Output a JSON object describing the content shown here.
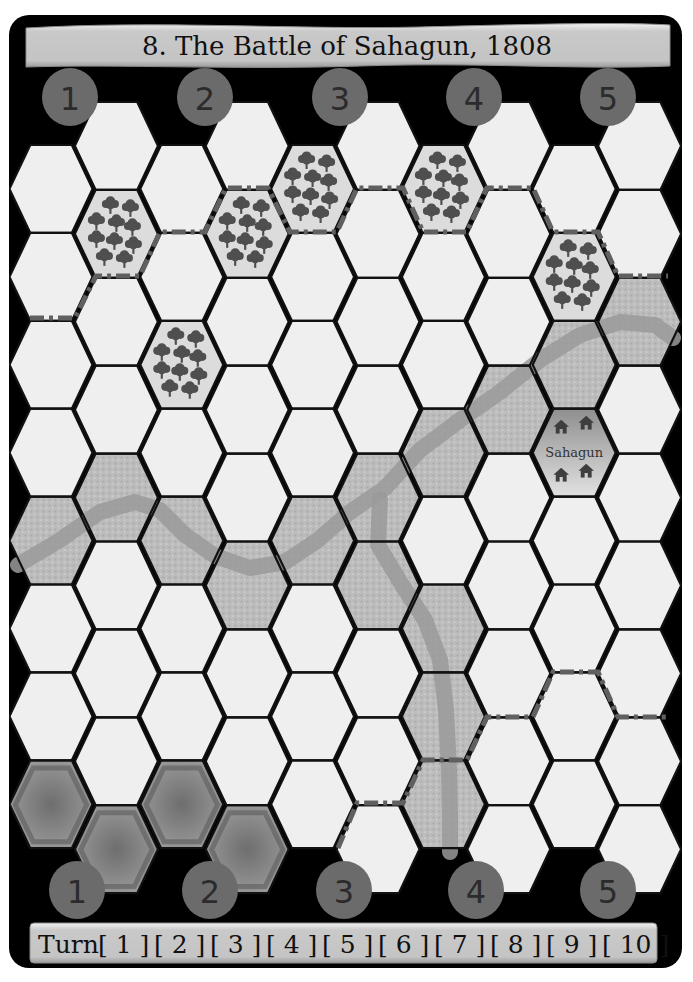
{
  "title": "8. The Battle of Sahagun, 1808",
  "colors": {
    "board_background": "#000000",
    "clear_hex": "#efefef",
    "forest_hex": "#dcdcdc",
    "marsh_hex": "#b9b9b9",
    "start_hex": "#8a8a8a",
    "badge": "#6b6b6b",
    "banner": "#c6c6c6",
    "road": "#606060",
    "river": "#9a9a9a"
  },
  "top_section_markers": [
    {
      "label": "1",
      "x": 70,
      "y": 97
    },
    {
      "label": "2",
      "x": 205,
      "y": 97
    },
    {
      "label": "3",
      "x": 340,
      "y": 97
    },
    {
      "label": "4",
      "x": 474,
      "y": 97
    },
    {
      "label": "5",
      "x": 608,
      "y": 97
    }
  ],
  "bottom_section_markers": [
    {
      "label": "1",
      "x": 77,
      "y": 890
    },
    {
      "label": "2",
      "x": 210,
      "y": 890
    },
    {
      "label": "3",
      "x": 344,
      "y": 890
    },
    {
      "label": "4",
      "x": 476,
      "y": 890
    },
    {
      "label": "5",
      "x": 608,
      "y": 890
    }
  ],
  "grid": {
    "columns": 10,
    "col0_center_x": 51,
    "col_step": 65.4,
    "hex_half_width": 41.5,
    "hex_height": 87.9,
    "even_col_top": 145,
    "odd_col_top": 102,
    "even_col_rows": 8,
    "odd_col_rows": 9
  },
  "terrain": [
    {
      "col": 1,
      "row": 1,
      "type": "forest"
    },
    {
      "col": 3,
      "row": 1,
      "type": "forest"
    },
    {
      "col": 4,
      "row": 0,
      "type": "forest"
    },
    {
      "col": 6,
      "row": 0,
      "type": "forest"
    },
    {
      "col": 8,
      "row": 1,
      "type": "forest"
    },
    {
      "col": 2,
      "row": 2,
      "type": "forest"
    },
    {
      "col": 9,
      "row": 2,
      "type": "marsh"
    },
    {
      "col": 8,
      "row": 2,
      "type": "marsh"
    },
    {
      "col": 7,
      "row": 3,
      "type": "marsh"
    },
    {
      "col": 6,
      "row": 3,
      "type": "marsh"
    },
    {
      "col": 5,
      "row": 4,
      "type": "marsh"
    },
    {
      "col": 5,
      "row": 5,
      "type": "marsh"
    },
    {
      "col": 4,
      "row": 4,
      "type": "marsh"
    },
    {
      "col": 3,
      "row": 5,
      "type": "marsh"
    },
    {
      "col": 2,
      "row": 4,
      "type": "marsh"
    },
    {
      "col": 1,
      "row": 4,
      "type": "marsh"
    },
    {
      "col": 0,
      "row": 4,
      "type": "marsh"
    },
    {
      "col": 6,
      "row": 5,
      "type": "marsh"
    },
    {
      "col": 6,
      "row": 6,
      "type": "marsh"
    },
    {
      "col": 6,
      "row": 7,
      "type": "marsh"
    },
    {
      "col": 8,
      "row": 3,
      "type": "town",
      "label": "Sahagun"
    },
    {
      "col": 0,
      "row": 7,
      "type": "start"
    },
    {
      "col": 1,
      "row": 8,
      "type": "start"
    },
    {
      "col": 2,
      "row": 7,
      "type": "start"
    },
    {
      "col": 3,
      "row": 8,
      "type": "start"
    }
  ],
  "town": {
    "name": "Sahagun"
  },
  "roads": [
    [
      [
        30,
        318
      ],
      [
        75,
        318
      ],
      [
        96,
        276
      ],
      [
        140,
        276
      ],
      [
        160,
        232
      ],
      [
        205,
        232
      ],
      [
        226,
        188
      ],
      [
        268,
        188
      ],
      [
        290,
        232
      ],
      [
        337,
        232
      ],
      [
        357,
        188
      ],
      [
        403,
        188
      ],
      [
        423,
        232
      ],
      [
        467,
        232
      ],
      [
        487,
        188
      ],
      [
        533,
        188
      ],
      [
        553,
        232
      ],
      [
        598,
        232
      ],
      [
        618,
        276
      ],
      [
        668,
        276
      ]
    ],
    [
      [
        338,
        848
      ],
      [
        357,
        803
      ],
      [
        403,
        803
      ],
      [
        423,
        760
      ],
      [
        467,
        760
      ],
      [
        487,
        717
      ],
      [
        533,
        717
      ],
      [
        553,
        672
      ],
      [
        598,
        672
      ],
      [
        618,
        717
      ],
      [
        666,
        717
      ]
    ]
  ],
  "rivers": [
    [
      [
        18,
        565
      ],
      [
        60,
        540
      ],
      [
        100,
        512
      ],
      [
        135,
        502
      ],
      [
        160,
        510
      ],
      [
        185,
        535
      ],
      [
        215,
        556
      ],
      [
        250,
        568
      ],
      [
        285,
        562
      ],
      [
        318,
        540
      ],
      [
        350,
        512
      ],
      [
        385,
        488
      ],
      [
        420,
        450
      ],
      [
        460,
        420
      ],
      [
        500,
        392
      ],
      [
        540,
        360
      ],
      [
        580,
        335
      ],
      [
        620,
        322
      ],
      [
        655,
        325
      ],
      [
        673,
        338
      ]
    ],
    [
      [
        380,
        500
      ],
      [
        378,
        545
      ],
      [
        402,
        585
      ],
      [
        425,
        620
      ],
      [
        440,
        660
      ],
      [
        446,
        710
      ],
      [
        449,
        770
      ],
      [
        450,
        820
      ],
      [
        450,
        852
      ]
    ]
  ],
  "turn_track": {
    "label": "Turn",
    "turns": [
      "1",
      "2",
      "3",
      "4",
      "5",
      "6",
      "7",
      "8",
      "9",
      "10"
    ]
  }
}
